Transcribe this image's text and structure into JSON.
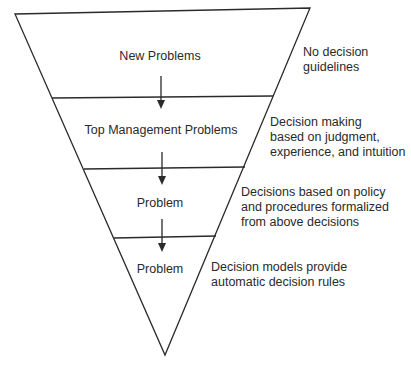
{
  "diagram": {
    "type": "inverted-triangle-hierarchy",
    "levels": [
      {
        "label": "New Problems",
        "description": [
          "No decision",
          "guidelines"
        ]
      },
      {
        "label": "Top Management Problems",
        "description": [
          "Decision making",
          "based on judgment,",
          "experience, and intuition"
        ]
      },
      {
        "label": "Problem",
        "description": [
          "Decisions based on policy",
          "and procedures formalized",
          "from above decisions"
        ]
      },
      {
        "label": "Problem",
        "description": [
          "Decision models provide",
          "automatic decision rules"
        ]
      }
    ],
    "colors": {
      "line": "#2a2a2a",
      "background": "#ffffff"
    }
  }
}
